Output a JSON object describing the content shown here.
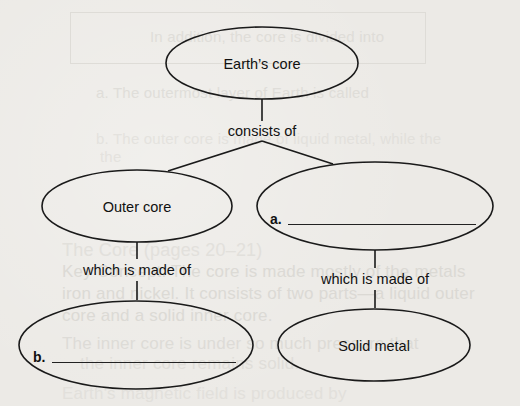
{
  "diagram": {
    "type": "concept-map",
    "nodes": {
      "root": {
        "label": "Earth’s core"
      },
      "outer_core": {
        "label": "Outer core"
      },
      "inner_blank": {
        "blank_letter": "a.",
        "answer": ""
      },
      "outer_material_blank": {
        "blank_letter": "b.",
        "answer": ""
      },
      "solid_metal": {
        "label": "Solid metal"
      }
    },
    "links": {
      "root_children": {
        "label": "consists of"
      },
      "outer_core_made_of": {
        "label": "which is made of"
      },
      "inner_made_of": {
        "label": "which is made of"
      }
    },
    "colors": {
      "line": "#1a1a1a",
      "paper": "#eceae6",
      "ghost_text": "#d6d4cf"
    }
  },
  "ghost_text": {
    "line1": "In addition, the core is divided into",
    "line2": "a. The outermost layer of Earth is called",
    "line3": "b. The outer core is made of liquid metal, while the",
    "line4": "the",
    "line5": "The Core (pages 20–21)",
    "line6": "Key Concept: The core is made mostly of the metals",
    "line7": "iron and nickel. It consists of two parts—a liquid outer",
    "line8": "core and a solid inner core.",
    "line9": "The inner core is under so much pressure that",
    "line10": "the inner core remains solid.",
    "line11": "Earth's magnetic field is produced by"
  }
}
